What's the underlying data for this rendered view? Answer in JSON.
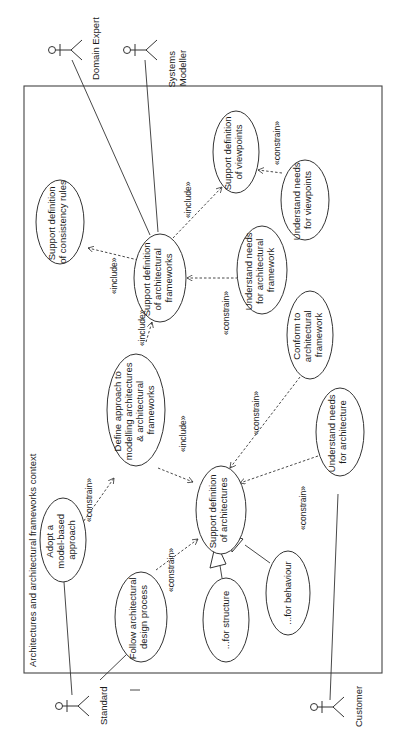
{
  "diagram": {
    "type": "uml-use-case",
    "orientation": "rotated-90-ccw",
    "frame_title": "Architectures and architectural frameworks context",
    "actors": [
      {
        "id": "domain_expert",
        "label": "Domain Expert"
      },
      {
        "id": "systems_modeller",
        "label_lines": [
          "Systems",
          "Modeller"
        ]
      },
      {
        "id": "standard",
        "label": "Standard"
      },
      {
        "id": "customer",
        "label": "Customer"
      }
    ],
    "use_cases": [
      {
        "id": "consistency",
        "lines": [
          "Support definition",
          "of consistency rules"
        ]
      },
      {
        "id": "frameworks",
        "lines": [
          "Support definition",
          "of architectural",
          "frameworks"
        ]
      },
      {
        "id": "viewpoints",
        "lines": [
          "Support definition",
          "of viewpoints"
        ]
      },
      {
        "id": "needs_viewpoints",
        "lines": [
          "Understand needs",
          "for viewpoints"
        ]
      },
      {
        "id": "needs_framework",
        "lines": [
          "Understand needs",
          "for architectural",
          "framework"
        ]
      },
      {
        "id": "define_approach",
        "lines": [
          "Define approach to",
          "modelling architectures",
          "& architectural",
          "frameworks"
        ]
      },
      {
        "id": "conform",
        "lines": [
          "Conform to",
          "architectural",
          "framework"
        ]
      },
      {
        "id": "adopt",
        "lines": [
          "Adopt a",
          "model-based",
          "approach"
        ]
      },
      {
        "id": "architectures",
        "lines": [
          "Support definition",
          "of architectures"
        ]
      },
      {
        "id": "needs_architecture",
        "lines": [
          "Understand needs",
          "for architecture"
        ]
      },
      {
        "id": "follow_process",
        "lines": [
          "Follow architectural",
          "design process"
        ]
      },
      {
        "id": "structure",
        "lines": [
          "...for structure"
        ]
      },
      {
        "id": "behaviour",
        "lines": [
          "...for behaviour"
        ]
      }
    ],
    "relationships": [
      {
        "from": "frameworks",
        "to": "consistency",
        "stereotype": "«include»"
      },
      {
        "from": "frameworks",
        "to": "viewpoints",
        "stereotype": "«include»"
      },
      {
        "from": "define_approach",
        "to": "frameworks",
        "stereotype": "«include»"
      },
      {
        "from": "define_approach",
        "to": "architectures",
        "stereotype": "«include»"
      },
      {
        "from": "needs_viewpoints",
        "to": "viewpoints",
        "stereotype": "«constrain»"
      },
      {
        "from": "needs_framework",
        "to": "frameworks",
        "stereotype": "«constrain»"
      },
      {
        "from": "adopt",
        "to": "define_approach",
        "stereotype": "«constrain»"
      },
      {
        "from": "conform",
        "to": "architectures",
        "stereotype": "«constrain»"
      },
      {
        "from": "follow_process",
        "to": "architectures",
        "stereotype": "«constrain»"
      },
      {
        "from": "needs_architecture",
        "to": "architectures",
        "stereotype": "«constrain»"
      },
      {
        "from": "structure",
        "to": "architectures",
        "type": "generalization"
      },
      {
        "from": "behaviour",
        "to": "architectures",
        "type": "generalization"
      },
      {
        "from": "domain_expert",
        "to": "frameworks",
        "type": "association"
      },
      {
        "from": "systems_modeller",
        "to": "frameworks",
        "type": "association"
      },
      {
        "from": "standard",
        "to": "adopt",
        "type": "association"
      },
      {
        "from": "standard",
        "to": "follow_process",
        "type": "association"
      },
      {
        "from": "customer",
        "to": "needs_architecture",
        "type": "association"
      }
    ],
    "stereotypes": {
      "include": "«include»",
      "constrain": "«constrain»"
    }
  }
}
